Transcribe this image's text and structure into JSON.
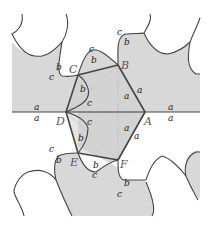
{
  "figure": {
    "colors": {
      "shaded": "#d8d8d8",
      "white": "#fafafa",
      "line": "#444444",
      "hexagon": "#444444",
      "dotted": "#aaaaaa"
    },
    "vertices": {
      "A": "A",
      "B": "B",
      "C": "C",
      "D": "D",
      "E": "E",
      "F": "F"
    },
    "edge_labels": {
      "top_left_a": "a",
      "bottom_left_a": "a",
      "top_right_a": "a",
      "bottom_right_a": "a",
      "BA_inner_a": "a",
      "BA_outer_a": "a",
      "AF_inner_a": "a",
      "AF_outer_a": "a",
      "C_left_b": "b",
      "C_left_c": "c",
      "CB_top_b": "b",
      "CB_top_c": "c",
      "B_top_b": "b",
      "B_top_c": "c",
      "CD_b": "b",
      "CD_c": "c",
      "DE_c": "c",
      "DE_b": "b",
      "E_left_c": "c",
      "E_left_b": "b",
      "EF_b": "b",
      "EF_c": "c",
      "F_bottom_b": "b",
      "F_bottom_c": "c"
    }
  }
}
